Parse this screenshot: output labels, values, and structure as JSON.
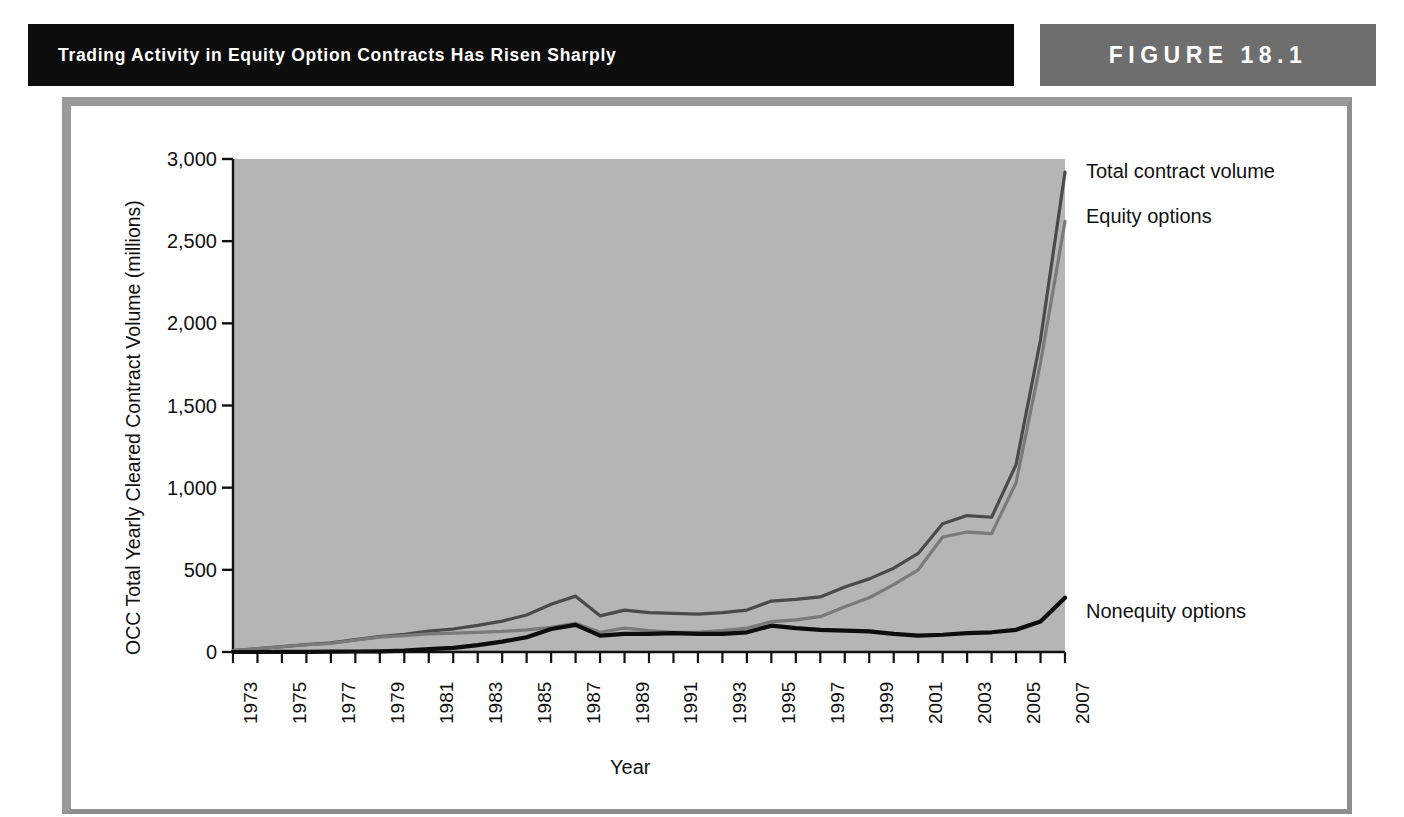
{
  "header": {
    "title": "Trading Activity in Equity Option Contracts Has Risen Sharply",
    "figure_badge": "FIGURE  18.1",
    "banner_color": "#0d0d0d",
    "badge_color": "#6e6e6e",
    "frame_color": "#9a9a9a"
  },
  "chart_data": {
    "type": "line",
    "title": "Trading Activity in Equity Option Contracts Has Risen Sharply",
    "xlabel": "Year",
    "ylabel": "OCC Total Yearly Cleared Contract Volume (millions)",
    "xlim": [
      1973,
      2007
    ],
    "ylim": [
      0,
      3000
    ],
    "ytick_labels": [
      "0",
      "500",
      "1,000",
      "1,500",
      "2,000",
      "2,500",
      "3,000"
    ],
    "ytick_values": [
      0,
      500,
      1000,
      1500,
      2000,
      2500,
      3000
    ],
    "xtick_labels": [
      "1973",
      "1975",
      "1977",
      "1979",
      "1981",
      "1983",
      "1985",
      "1987",
      "1989",
      "1991",
      "1993",
      "1995",
      "1997",
      "1999",
      "2001",
      "2003",
      "2005",
      "2007"
    ],
    "xtick_values": [
      1973,
      1975,
      1977,
      1979,
      1981,
      1983,
      1985,
      1987,
      1989,
      1991,
      1993,
      1995,
      1997,
      1999,
      2001,
      2003,
      2005,
      2007
    ],
    "grid": false,
    "legend_position": "right-inline",
    "plot_background": "#b5b5b5",
    "x": [
      1973,
      1974,
      1975,
      1976,
      1977,
      1978,
      1979,
      1980,
      1981,
      1982,
      1983,
      1984,
      1985,
      1986,
      1987,
      1988,
      1989,
      1990,
      1991,
      1992,
      1993,
      1994,
      1995,
      1996,
      1997,
      1998,
      1999,
      2000,
      2001,
      2002,
      2003,
      2004,
      2005,
      2006,
      2007
    ],
    "series": [
      {
        "name": "Total contract volume",
        "color": "#4a4a4a",
        "width": 3.2,
        "values": [
          8,
          20,
          33,
          45,
          55,
          75,
          94,
          108,
          127,
          140,
          162,
          188,
          225,
          290,
          340,
          220,
          255,
          240,
          235,
          230,
          240,
          255,
          310,
          320,
          335,
          395,
          445,
          510,
          600,
          780,
          830,
          820,
          1140,
          1900,
          2920
        ]
      },
      {
        "name": "Equity options",
        "color": "#7a7a7a",
        "width": 3.2,
        "values": [
          8,
          20,
          32,
          44,
          53,
          72,
          90,
          100,
          110,
          115,
          120,
          125,
          135,
          150,
          175,
          120,
          145,
          130,
          120,
          120,
          130,
          145,
          185,
          195,
          215,
          275,
          330,
          410,
          500,
          700,
          730,
          720,
          1030,
          1760,
          2620
        ]
      },
      {
        "name": "Nonequity options",
        "color": "#0d0d0d",
        "width": 4.2,
        "values": [
          0,
          0,
          1,
          1,
          2,
          3,
          4,
          8,
          17,
          25,
          42,
          63,
          90,
          140,
          165,
          100,
          110,
          110,
          115,
          110,
          110,
          120,
          160,
          145,
          135,
          130,
          125,
          110,
          100,
          105,
          115,
          120,
          135,
          185,
          330
        ]
      }
    ],
    "annotations": [
      {
        "text": "Total contract volume",
        "series": "Total contract volume"
      },
      {
        "text": "Equity options",
        "series": "Equity options"
      },
      {
        "text": "Nonequity options",
        "series": "Nonequity options"
      }
    ]
  }
}
